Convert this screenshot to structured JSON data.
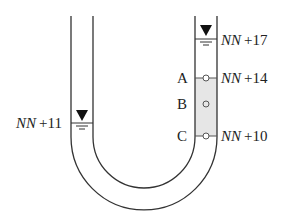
{
  "diagram": {
    "type": "u-tube-manometer",
    "left_level": {
      "label_prefix": "NN",
      "label_suffix": "+11",
      "elevation": 11
    },
    "right_level": {
      "label_prefix": "NN",
      "label_suffix": "+17",
      "elevation": 17
    },
    "points": [
      {
        "name": "A",
        "label_prefix": "NN",
        "label_suffix": "+14",
        "elevation": 14
      },
      {
        "name": "B",
        "label_prefix": "",
        "label_suffix": "",
        "elevation": null
      },
      {
        "name": "C",
        "label_prefix": "NN",
        "label_suffix": "+10",
        "elevation": 10
      }
    ],
    "colors": {
      "wall": "#333333",
      "shaded_region": "#e6e6e6",
      "marker": "#555555"
    }
  }
}
